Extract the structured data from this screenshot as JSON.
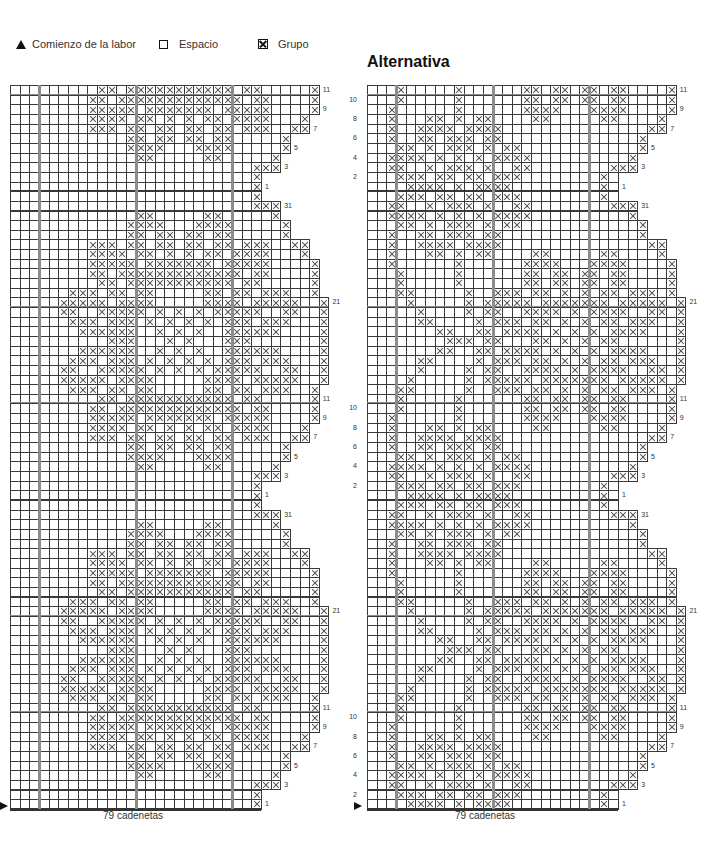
{
  "legend": {
    "start_label": "Comienzo de la labor",
    "space_label": "Espacio",
    "group_label": "Grupo",
    "start_icon": "triangle-icon",
    "space_icon": "empty-square-icon",
    "group_icon": "crossed-square-icon"
  },
  "alt_title": "Alternativa",
  "footer": {
    "left": "79 cadenetas",
    "right": "79 cadenetas"
  },
  "grid": {
    "cell": 9.65,
    "top": 85,
    "thick_cols": [
      3,
      13,
      23
    ],
    "colors": {
      "line": "#3a3a3a",
      "thick": "#8c8c8c",
      "dark": "#333333",
      "cross": "#555555"
    }
  },
  "charts": {
    "left": {
      "x0": 10,
      "right_labels": [
        "11",
        "9",
        "7",
        "5",
        "3",
        "1",
        "31",
        "21",
        "11",
        "9",
        "7",
        "5",
        "3",
        "1",
        "31",
        "21",
        "11",
        "9",
        "7",
        "5",
        "3",
        "1"
      ],
      "left_labels": [
        "10",
        "8",
        "6",
        "4",
        "2",
        "10",
        "8",
        "6",
        "4",
        "2",
        "10",
        "8",
        "6",
        "4",
        "2"
      ],
      "block": {
        "r31": {
          "w": 28,
          "x": [
            25,
            26,
            27
          ]
        },
        "r30": {
          "w": 28,
          "x": [
            13,
            14,
            20,
            21,
            27
          ]
        },
        "r29": {
          "w": 29,
          "x": [
            12,
            13,
            14,
            15,
            19,
            20,
            21,
            22,
            28
          ]
        },
        "r28": {
          "w": 29,
          "x": [
            12,
            13,
            15,
            16,
            18,
            19,
            21,
            22,
            28
          ]
        },
        "r27": {
          "w": 31,
          "x": [
            8,
            9,
            10,
            12,
            13,
            15,
            16,
            18,
            19,
            21,
            22,
            24,
            25,
            26,
            29,
            30
          ]
        },
        "r26": {
          "w": 31,
          "x": [
            8,
            9,
            10,
            11,
            13,
            14,
            16,
            18,
            20,
            21,
            23,
            24,
            25,
            26,
            30
          ]
        },
        "r25": {
          "w": 32,
          "x": [
            8,
            9,
            10,
            11,
            12,
            14,
            15,
            16,
            17,
            18,
            19,
            20,
            22,
            23,
            24,
            25,
            26,
            31
          ]
        },
        "r24": {
          "w": 32,
          "x": [
            8,
            9,
            11,
            12,
            13,
            14,
            15,
            16,
            17,
            18,
            19,
            20,
            21,
            22,
            23,
            25,
            26,
            31
          ]
        },
        "r23": {
          "w": 32,
          "x": [
            9,
            10,
            12,
            13,
            14,
            15,
            16,
            17,
            18,
            19,
            20,
            21,
            22,
            24,
            25,
            31
          ]
        },
        "r22": {
          "w": 32,
          "x": [
            6,
            7,
            8,
            10,
            11,
            13,
            14,
            20,
            21,
            23,
            24,
            26,
            27,
            28,
            31
          ]
        },
        "r21": {
          "w": 33,
          "x": [
            5,
            6,
            7,
            8,
            9,
            11,
            12,
            13,
            14,
            20,
            21,
            22,
            23,
            25,
            26,
            27,
            28,
            29,
            32
          ]
        },
        "r20": {
          "w": 33,
          "x": [
            5,
            6,
            9,
            10,
            11,
            12,
            13,
            15,
            17,
            19,
            21,
            22,
            23,
            24,
            25,
            28,
            29,
            32
          ]
        },
        "r19": {
          "w": 33,
          "x": [
            6,
            7,
            8,
            10,
            11,
            12,
            14,
            16,
            18,
            20,
            22,
            23,
            24,
            26,
            27,
            28,
            32
          ]
        },
        "r18": {
          "w": 33,
          "x": [
            7,
            8,
            9,
            10,
            11,
            12,
            15,
            17,
            19,
            22,
            23,
            24,
            25,
            26,
            27,
            32
          ]
        },
        "r17": {
          "w": 33,
          "x": [
            10,
            11,
            12,
            16,
            18,
            22,
            23,
            24,
            32
          ]
        },
        "r16": {
          "w": 33,
          "x": [
            7,
            8,
            9,
            10,
            11,
            12,
            15,
            17,
            19,
            22,
            23,
            24,
            25,
            26,
            27,
            32
          ]
        },
        "r15": {
          "w": 33,
          "x": [
            6,
            7,
            8,
            10,
            11,
            12,
            14,
            16,
            18,
            20,
            22,
            23,
            24,
            26,
            27,
            28,
            32
          ]
        },
        "r14": {
          "w": 33,
          "x": [
            5,
            6,
            9,
            10,
            11,
            12,
            13,
            15,
            17,
            19,
            21,
            22,
            23,
            24,
            25,
            28,
            29,
            32
          ]
        },
        "r13": {
          "w": 33,
          "x": [
            5,
            6,
            7,
            8,
            9,
            11,
            12,
            13,
            14,
            20,
            21,
            22,
            23,
            25,
            26,
            27,
            28,
            29,
            32
          ]
        },
        "r12": {
          "w": 32,
          "x": [
            6,
            7,
            8,
            10,
            11,
            13,
            14,
            20,
            21,
            23,
            24,
            26,
            27,
            28,
            31
          ]
        },
        "r11": {
          "w": 32,
          "x": [
            9,
            10,
            12,
            13,
            14,
            15,
            16,
            17,
            18,
            19,
            20,
            21,
            22,
            24,
            25,
            31
          ]
        },
        "r10": {
          "w": 32,
          "x": [
            8,
            9,
            11,
            12,
            13,
            14,
            15,
            16,
            17,
            18,
            19,
            20,
            21,
            22,
            23,
            25,
            26,
            31
          ]
        },
        "r9": {
          "w": 32,
          "x": [
            8,
            9,
            10,
            11,
            12,
            14,
            15,
            16,
            17,
            18,
            19,
            20,
            22,
            23,
            24,
            25,
            26,
            31
          ]
        },
        "r8": {
          "w": 31,
          "x": [
            8,
            9,
            10,
            11,
            13,
            14,
            16,
            18,
            20,
            21,
            23,
            24,
            25,
            26,
            30
          ]
        },
        "r7": {
          "w": 31,
          "x": [
            8,
            9,
            10,
            12,
            13,
            15,
            16,
            18,
            19,
            21,
            22,
            24,
            25,
            26,
            29,
            30
          ]
        },
        "r6": {
          "w": 29,
          "x": [
            12,
            13,
            15,
            16,
            18,
            19,
            21,
            22,
            28
          ]
        },
        "r5": {
          "w": 29,
          "x": [
            12,
            13,
            14,
            15,
            19,
            20,
            21,
            22,
            28
          ]
        },
        "r4": {
          "w": 28,
          "x": [
            13,
            14,
            20,
            21,
            27
          ]
        },
        "r3": {
          "w": 28,
          "x": [
            25,
            26,
            27
          ]
        },
        "r2": {
          "w": 26,
          "x": [
            25
          ]
        },
        "r1": {
          "w": 26,
          "x": [
            25
          ]
        },
        "filler": {
          "w": 26,
          "x": [
            25
          ]
        }
      }
    },
    "right": {
      "x0": 367,
      "right_labels": [
        "11",
        "9",
        "7",
        "5",
        "3",
        "1",
        "31",
        "21",
        "11",
        "9",
        "7",
        "5",
        "3",
        "1",
        "31",
        "21",
        "11",
        "9",
        "7",
        "5",
        "3",
        "1"
      ],
      "left_labels": [
        "10",
        "8",
        "6",
        "4",
        "2",
        "10",
        "8",
        "6",
        "4",
        "2",
        "10",
        "8",
        "6",
        "4",
        "2"
      ],
      "block": {
        "r31": {
          "w": 28,
          "x": [
            2,
            3,
            6,
            8,
            9,
            10,
            12,
            15,
            16,
            25,
            26,
            27
          ]
        },
        "r30": {
          "w": 28,
          "x": [
            2,
            3,
            4,
            5,
            7,
            9,
            11,
            13,
            14,
            15,
            16,
            27
          ]
        },
        "r29": {
          "w": 29,
          "x": [
            3,
            4,
            6,
            8,
            9,
            10,
            12,
            14,
            15,
            28
          ]
        },
        "r28": {
          "w": 29,
          "x": [
            2,
            5,
            6,
            8,
            9,
            10,
            12,
            13,
            28
          ]
        },
        "r27": {
          "w": 31,
          "x": [
            2,
            5,
            6,
            7,
            8,
            10,
            11,
            12,
            13,
            29,
            30
          ]
        },
        "r26": {
          "w": 31,
          "x": [
            2,
            6,
            7,
            9,
            11,
            12,
            17,
            18,
            24,
            25,
            30
          ]
        },
        "r25": {
          "w": 32,
          "x": [
            2,
            9,
            16,
            17,
            18,
            19,
            23,
            24,
            25,
            26,
            31
          ]
        },
        "r24": {
          "w": 32,
          "x": [
            3,
            9,
            16,
            17,
            19,
            20,
            22,
            23,
            25,
            26,
            31
          ]
        },
        "r23": {
          "w": 32,
          "x": [
            3,
            9,
            16,
            17,
            19,
            20,
            22,
            23,
            25,
            26,
            31
          ]
        },
        "r22": {
          "w": 32,
          "x": [
            3,
            4,
            10,
            13,
            14,
            15,
            17,
            18,
            20,
            22,
            24,
            25,
            27,
            28,
            29,
            31
          ]
        },
        "r21": {
          "w": 33,
          "x": [
            4,
            10,
            12,
            13,
            14,
            15,
            16,
            18,
            19,
            20,
            21,
            22,
            23,
            24,
            26,
            27,
            28,
            29,
            30,
            32
          ]
        },
        "r20": {
          "w": 33,
          "x": [
            5,
            10,
            12,
            13,
            16,
            17,
            18,
            19,
            21,
            23,
            24,
            25,
            26,
            29,
            30,
            32
          ]
        },
        "r19": {
          "w": 33,
          "x": [
            5,
            6,
            11,
            13,
            14,
            15,
            17,
            18,
            20,
            22,
            24,
            25,
            27,
            28,
            29,
            32
          ]
        },
        "r18": {
          "w": 33,
          "x": [
            7,
            8,
            11,
            12,
            14,
            15,
            16,
            17,
            19,
            21,
            23,
            25,
            26,
            27,
            28,
            32
          ]
        },
        "r17": {
          "w": 33,
          "x": [
            8,
            9,
            10,
            12,
            13,
            17,
            18,
            20,
            22,
            24,
            25,
            32
          ]
        },
        "r16": {
          "w": 33,
          "x": [
            7,
            8,
            11,
            12,
            14,
            15,
            16,
            17,
            19,
            21,
            23,
            25,
            26,
            27,
            28,
            32
          ]
        },
        "r15": {
          "w": 33,
          "x": [
            5,
            6,
            11,
            13,
            14,
            15,
            17,
            18,
            20,
            22,
            24,
            25,
            27,
            28,
            29,
            32
          ]
        },
        "r14": {
          "w": 33,
          "x": [
            5,
            10,
            12,
            13,
            16,
            17,
            18,
            19,
            21,
            23,
            24,
            25,
            26,
            29,
            30,
            32
          ]
        },
        "r13": {
          "w": 33,
          "x": [
            4,
            10,
            12,
            13,
            14,
            15,
            16,
            18,
            19,
            20,
            21,
            22,
            23,
            24,
            26,
            27,
            28,
            29,
            30,
            32
          ]
        },
        "r12": {
          "w": 32,
          "x": [
            3,
            4,
            10,
            13,
            14,
            15,
            17,
            18,
            20,
            22,
            24,
            25,
            27,
            28,
            29,
            31
          ]
        },
        "r11": {
          "w": 32,
          "x": [
            3,
            9,
            16,
            17,
            19,
            20,
            22,
            23,
            25,
            26,
            31
          ]
        },
        "r10": {
          "w": 32,
          "x": [
            3,
            9,
            16,
            17,
            19,
            20,
            22,
            23,
            25,
            26,
            31
          ]
        },
        "r9": {
          "w": 32,
          "x": [
            2,
            9,
            16,
            17,
            18,
            19,
            23,
            24,
            25,
            26,
            31
          ]
        },
        "r8": {
          "w": 31,
          "x": [
            2,
            6,
            7,
            9,
            11,
            12,
            17,
            18,
            24,
            25,
            30
          ]
        },
        "r7": {
          "w": 31,
          "x": [
            2,
            5,
            6,
            7,
            8,
            10,
            11,
            12,
            13,
            29,
            30
          ]
        },
        "r6": {
          "w": 29,
          "x": [
            2,
            5,
            6,
            8,
            9,
            10,
            12,
            13,
            28
          ]
        },
        "r5": {
          "w": 29,
          "x": [
            3,
            4,
            6,
            8,
            9,
            10,
            12,
            14,
            15,
            28
          ]
        },
        "r4": {
          "w": 28,
          "x": [
            2,
            3,
            4,
            5,
            7,
            9,
            11,
            13,
            14,
            15,
            16,
            27
          ]
        },
        "r3": {
          "w": 28,
          "x": [
            2,
            3,
            6,
            8,
            9,
            10,
            12,
            15,
            16,
            25,
            26,
            27
          ]
        },
        "r2": {
          "w": 26,
          "x": [
            3,
            4,
            5,
            7,
            8,
            10,
            11,
            13,
            14,
            15,
            24
          ]
        },
        "r1": {
          "w": 26,
          "x": [
            4,
            5,
            6,
            7,
            9,
            11,
            12,
            13,
            14,
            24
          ]
        },
        "filler": {
          "w": 26,
          "x": [
            3,
            4,
            5,
            7,
            8,
            10,
            11,
            13,
            14,
            15,
            24
          ]
        }
      }
    }
  }
}
